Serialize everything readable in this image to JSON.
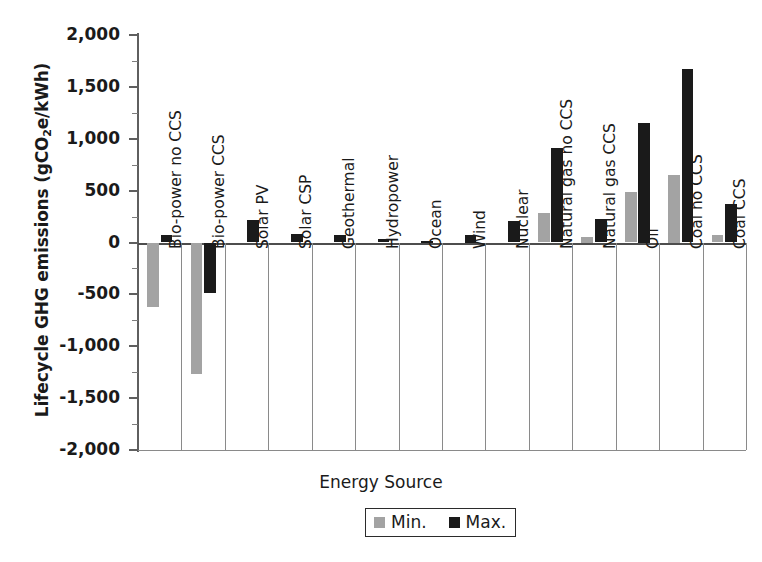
{
  "chart_data": {
    "type": "bar",
    "title": "",
    "xlabel": "Energy Source",
    "ylabel_main": "Lifecycle GHG emissions (gCO",
    "ylabel_sub": "2",
    "ylabel_tail": "e/kWh)",
    "ylabel_full": "Lifecycle GHG emissions (gCO2e/kWh)",
    "ylim": [
      -2000,
      2000
    ],
    "ytick_step": 500,
    "yminor_step": 250,
    "grid": false,
    "legend_position": "bottom-center",
    "ytick_labels": [
      "2,000",
      "1,500",
      "1,000",
      "500",
      "0",
      "-500",
      "-1,000",
      "-1,500",
      "-2,000"
    ],
    "ytick_values": [
      2000,
      1500,
      1000,
      500,
      0,
      -500,
      -1000,
      -1500,
      -2000
    ],
    "categories": [
      "Bio-power no CCS",
      "Bio-power CCS",
      "Solar PV",
      "Solar CSP",
      "Geothermal",
      "Hydropower",
      "Ocean",
      "Wind",
      "Nuclear",
      "Natural gas no CCS",
      "Natural gas CCS",
      "Oil",
      "Coal CCS"
    ],
    "series": [
      {
        "name": "Min.",
        "color": "#a3a3a3",
        "values": [
          -620,
          -1270,
          0,
          0,
          0,
          0,
          0,
          0,
          0,
          280,
          50,
          490,
          70
        ]
      },
      {
        "name": "Max.",
        "color": "#1a1a1a",
        "values": [
          70,
          -490,
          220,
          80,
          70,
          30,
          15,
          75,
          210,
          910,
          230,
          1150,
          370
        ]
      }
    ],
    "legend_entries": [
      {
        "label": "Min.",
        "color": "#a3a3a3"
      },
      {
        "label": "Max.",
        "color": "#1a1a1a"
      }
    ]
  },
  "extra_category": {
    "label": "Coal no CCS",
    "min": 650,
    "max": 1670,
    "index_after": "Oil"
  },
  "colors": {
    "min_series": "#a3a3a3",
    "max_series": "#1a1a1a",
    "axis": "#5f5f5f",
    "background": "#ffffff"
  }
}
